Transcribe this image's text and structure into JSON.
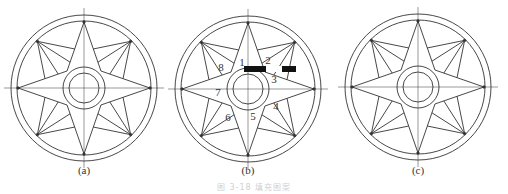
{
  "figures": [
    {
      "id": "a",
      "label": "(a)",
      "cx": 84,
      "cy": 88,
      "numbered": false
    },
    {
      "id": "b",
      "label": "(b)",
      "cx": 248,
      "cy": 89,
      "numbered": true
    },
    {
      "id": "c",
      "label": "(c)",
      "cx": 418,
      "cy": 87,
      "numbered": false
    }
  ],
  "geometry": {
    "outer_circle_r": 73,
    "outer_circle2_r": 67,
    "star_tip_r": 66,
    "diagonal_tip_r": 66,
    "star_inner_r": 22,
    "hub_outer_r": 21,
    "hub_inner_r": 15,
    "stroke_color": "#333333"
  },
  "region_numbers": [
    "1",
    "2",
    "3",
    "4",
    "5",
    "6",
    "7",
    "8"
  ],
  "captions": {
    "a": "(a)",
    "b": "(b)",
    "c": "(c)",
    "figure_caption": "图 3-18   填充图案"
  }
}
